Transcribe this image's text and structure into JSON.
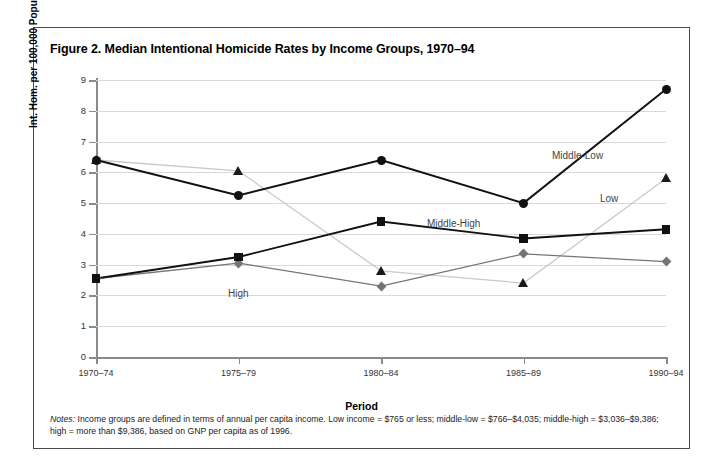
{
  "figure": {
    "title": "Figure 2. Median Intentional Homicide Rates by Income Groups, 1970–94",
    "notes_lead": "Notes:",
    "notes_text": " Income groups are defined in terms of annual per capita income. Low income = $765 or less; middle-low = $766–$4,035; middle-high = $3,036–$9,386; high = more than $9,386, based on GNP per capita as of 1996."
  },
  "axes": {
    "ylabel": "Int. Hom. per 100,000 Population",
    "xlabel": "Period",
    "yticks": [
      "0",
      "1",
      "2",
      "3",
      "4",
      "5",
      "6",
      "7",
      "8",
      "9"
    ],
    "xticks": [
      "1970–74",
      "1975–79",
      "1980–84",
      "1985–89",
      "1990–94"
    ]
  },
  "series_labels": {
    "middle_low": "Middle-Low",
    "low": "Low",
    "middle_high": "Middle-High",
    "high": "High"
  },
  "colors": {
    "middle_low": "#111111",
    "low": "#c9c9c9",
    "middle_high": "#111111",
    "high": "#757575",
    "grid": "#d9d9d9",
    "axis": "#8a8a8a",
    "border": "#4a4a4a"
  },
  "chart_data": {
    "type": "line",
    "title": "Figure 2. Median Intentional Homicide Rates by Income Groups, 1970–94",
    "xlabel": "Period",
    "ylabel": "Int. Hom. per 100,000 Population",
    "categories": [
      "1970–74",
      "1975–79",
      "1980–84",
      "1985–89",
      "1990–94"
    ],
    "ylim": [
      0,
      9
    ],
    "ytick_step": 1,
    "grid": true,
    "legend": "inline-labels",
    "series": [
      {
        "name": "Middle-Low",
        "marker": "circle",
        "color": "#111111",
        "values": [
          6.4,
          5.25,
          6.4,
          5.0,
          8.7
        ]
      },
      {
        "name": "Low",
        "marker": "triangle",
        "color": "#c9c9c9",
        "values": [
          6.4,
          6.05,
          2.8,
          2.4,
          5.8
        ]
      },
      {
        "name": "Middle-High",
        "marker": "square",
        "color": "#111111",
        "values": [
          2.55,
          3.25,
          4.4,
          3.85,
          4.15
        ]
      },
      {
        "name": "High",
        "marker": "diamond",
        "color": "#757575",
        "values": [
          2.55,
          3.05,
          2.3,
          3.35,
          3.1
        ]
      }
    ]
  }
}
